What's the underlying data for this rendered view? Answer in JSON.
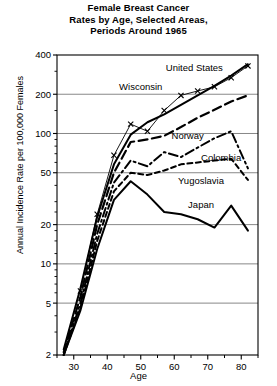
{
  "chart_data": {
    "type": "line",
    "title": "Female Breast Cancer Rates by Age, Selected Areas, Periods Around 1965",
    "title_lines": [
      "Female Breast Cancer",
      "Rates by Age, Selected Areas,",
      "Periods Around 1965"
    ],
    "xlabel": "Age",
    "ylabel": "Annual Incidence Rate per 100,000 Females",
    "yscale": "log",
    "ylim": [
      2,
      400
    ],
    "xlim": [
      25,
      85
    ],
    "grid": true,
    "grid_axis": "y",
    "legend_position": "inline-annotations",
    "ytick_labels": [
      "400",
      "200",
      "100",
      "50",
      "20",
      "10",
      "5",
      "2"
    ],
    "ytick_values": [
      400,
      200,
      100,
      50,
      20,
      10,
      5,
      2
    ],
    "xtick_labels": [
      "30",
      "40",
      "50",
      "60",
      "70",
      "80"
    ],
    "xtick_values": [
      30,
      40,
      50,
      60,
      70,
      80
    ],
    "xtick_minor_values": [
      25,
      35,
      45,
      55,
      65,
      75,
      85
    ],
    "series": [
      {
        "name": "United States",
        "style": "solid",
        "marker": "none",
        "x": [
          27,
          32,
          37,
          42,
          47,
          52,
          57,
          62,
          67,
          72,
          77,
          82
        ],
        "values": [
          2.2,
          6.5,
          23,
          58,
          98,
          122,
          140,
          166,
          196,
          232,
          278,
          340
        ]
      },
      {
        "name": "Wisconsin",
        "style": "solid-thin",
        "marker": "x",
        "x": [
          32,
          37,
          42,
          47,
          52,
          57,
          62,
          67,
          72,
          77,
          82
        ],
        "values": [
          6.2,
          24,
          68,
          118,
          104,
          150,
          196,
          212,
          228,
          268,
          330
        ]
      },
      {
        "name": "Norway",
        "style": "dashed",
        "marker": "none",
        "x": [
          27,
          32,
          37,
          42,
          47,
          52,
          57,
          62,
          67,
          72,
          77,
          82
        ],
        "values": [
          2.1,
          5.6,
          20,
          50,
          86,
          90,
          96,
          112,
          132,
          152,
          176,
          196
        ]
      },
      {
        "name": "Colombia",
        "style": "dash-dot",
        "marker": "none",
        "x": [
          27,
          32,
          37,
          42,
          47,
          52,
          57,
          62,
          67,
          72,
          77,
          82
        ],
        "values": [
          2.0,
          5.0,
          17,
          42,
          62,
          56,
          72,
          66,
          78,
          92,
          104,
          54
        ]
      },
      {
        "name": "Yugoslavia",
        "style": "dashed-short",
        "marker": "none",
        "x": [
          27,
          32,
          37,
          42,
          47,
          52,
          57,
          62,
          67,
          72,
          77,
          82
        ],
        "values": [
          2.0,
          4.6,
          15,
          36,
          50,
          48,
          52,
          58,
          60,
          62,
          64,
          44
        ]
      },
      {
        "name": "Japan",
        "style": "solid",
        "marker": "none",
        "x": [
          27,
          32,
          37,
          42,
          47,
          52,
          57,
          62,
          67,
          72,
          77,
          82
        ],
        "values": [
          1.9,
          4.4,
          13,
          31,
          43,
          34,
          25,
          24,
          22,
          19,
          28,
          18
        ]
      }
    ],
    "annotations": [
      {
        "text": "United States",
        "x": 66,
        "y": 300
      },
      {
        "text": "Wisconsin",
        "x": 50,
        "y": 215
      },
      {
        "text": "Norway",
        "x": 64,
        "y": 90
      },
      {
        "text": "Colombia",
        "x": 74,
        "y": 62
      },
      {
        "text": "Yugoslavia",
        "x": 68,
        "y": 41
      },
      {
        "text": "Japan",
        "x": 68,
        "y": 27
      }
    ]
  }
}
